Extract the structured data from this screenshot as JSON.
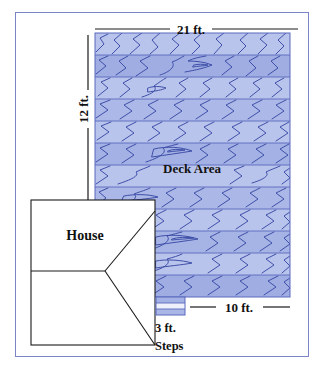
{
  "diagram": {
    "labels": {
      "width_dimension": "21 ft.",
      "height_dimension": "12 ft.",
      "deck_area": "Deck Area",
      "house": "House",
      "steps_width": "10 ft.",
      "steps_depth": "3 ft.",
      "steps": "Steps"
    },
    "colors": {
      "frame_border": "#7b85c6",
      "plank_light": "#b9c4ec",
      "plank_dark": "#9aa9e0",
      "grain_line": "#3f4fa8",
      "plank_edge": "#5a69bd",
      "outline": "#1a1a1a",
      "background": "#ffffff"
    },
    "measurements": {
      "deck_width_ft": 21,
      "deck_depth_ft": 12,
      "steps_width_ft": 10,
      "steps_depth_ft": 3,
      "step_count": 3,
      "plank_band_count": 12
    }
  }
}
